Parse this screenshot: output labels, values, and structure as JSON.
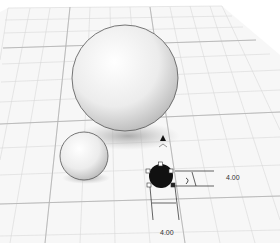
{
  "scene": {
    "type": "3d-workplane",
    "objects": [
      {
        "name": "large-sphere",
        "cx": 125,
        "cy": 78,
        "r": 53
      },
      {
        "name": "small-sphere",
        "cx": 84,
        "cy": 156,
        "r": 24
      },
      {
        "name": "selected-sphere",
        "cx": 161,
        "cy": 176,
        "r": 12
      }
    ]
  },
  "dimensions": {
    "width_label": "4.00",
    "depth_label": "4.00"
  },
  "colors": {
    "grid": "#d6d6d6",
    "sphere": "#f2f2f2",
    "selected": "#111111",
    "shadow": "#bdbdbd"
  }
}
